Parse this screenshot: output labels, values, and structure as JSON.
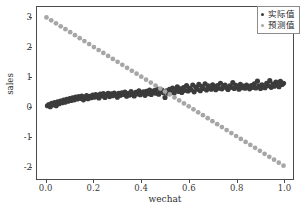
{
  "chart_data": {
    "type": "scatter",
    "title": "",
    "xlabel": "wechat",
    "ylabel": "sales",
    "xlim": [
      -0.04,
      1.04
    ],
    "ylim": [
      -2.45,
      3.35
    ],
    "xticks": [
      0.0,
      0.2,
      0.4,
      0.6,
      0.8,
      1.0
    ],
    "xtick_labels": [
      "0.0",
      "0.2",
      "0.4",
      "0.6",
      "0.8",
      "1.0"
    ],
    "yticks": [
      -2,
      -1,
      0,
      1,
      2,
      3
    ],
    "ytick_labels": [
      "-2",
      "-1",
      "0",
      "1",
      "2",
      "3"
    ],
    "grid": false,
    "legend_position": "upper right",
    "series": [
      {
        "name": "实际值",
        "color": "#3b3b3b",
        "marker": "o",
        "marker_size": 2.6,
        "points": [
          [
            0.004,
            0.02
          ],
          [
            0.01,
            0.06
          ],
          [
            0.016,
            -0.01
          ],
          [
            0.022,
            0.1
          ],
          [
            0.028,
            0.05
          ],
          [
            0.034,
            0.13
          ],
          [
            0.041,
            0.02
          ],
          [
            0.047,
            0.15
          ],
          [
            0.053,
            0.09
          ],
          [
            0.059,
            0.18
          ],
          [
            0.066,
            0.12
          ],
          [
            0.072,
            0.21
          ],
          [
            0.078,
            0.14
          ],
          [
            0.085,
            0.24
          ],
          [
            0.091,
            0.17
          ],
          [
            0.098,
            0.26
          ],
          [
            0.104,
            0.2
          ],
          [
            0.11,
            0.29
          ],
          [
            0.117,
            0.22
          ],
          [
            0.123,
            0.31
          ],
          [
            0.13,
            0.25
          ],
          [
            0.136,
            0.33
          ],
          [
            0.143,
            0.27
          ],
          [
            0.149,
            0.35
          ],
          [
            0.156,
            0.22
          ],
          [
            0.162,
            0.3
          ],
          [
            0.169,
            0.36
          ],
          [
            0.175,
            0.26
          ],
          [
            0.182,
            0.34
          ],
          [
            0.188,
            0.29
          ],
          [
            0.195,
            0.38
          ],
          [
            0.201,
            0.31
          ],
          [
            0.208,
            0.4
          ],
          [
            0.214,
            0.33
          ],
          [
            0.221,
            0.28
          ],
          [
            0.227,
            0.41
          ],
          [
            0.234,
            0.35
          ],
          [
            0.24,
            0.43
          ],
          [
            0.247,
            0.3
          ],
          [
            0.253,
            0.39
          ],
          [
            0.26,
            0.44
          ],
          [
            0.266,
            0.33
          ],
          [
            0.273,
            0.42
          ],
          [
            0.279,
            0.36
          ],
          [
            0.286,
            0.45
          ],
          [
            0.292,
            0.38
          ],
          [
            0.299,
            0.31
          ],
          [
            0.305,
            0.44
          ],
          [
            0.312,
            0.37
          ],
          [
            0.318,
            0.46
          ],
          [
            0.325,
            0.4
          ],
          [
            0.331,
            0.48
          ],
          [
            0.338,
            0.34
          ],
          [
            0.344,
            0.43
          ],
          [
            0.351,
            0.38
          ],
          [
            0.357,
            0.5
          ],
          [
            0.364,
            0.41
          ],
          [
            0.37,
            0.35
          ],
          [
            0.377,
            0.47
          ],
          [
            0.383,
            0.42
          ],
          [
            0.39,
            0.52
          ],
          [
            0.396,
            0.39
          ],
          [
            0.403,
            0.45
          ],
          [
            0.409,
            0.49
          ],
          [
            0.416,
            0.37
          ],
          [
            0.422,
            0.51
          ],
          [
            0.429,
            0.43
          ],
          [
            0.435,
            0.55
          ],
          [
            0.442,
            0.4
          ],
          [
            0.448,
            0.47
          ],
          [
            0.455,
            0.53
          ],
          [
            0.461,
            0.44
          ],
          [
            0.468,
            0.58
          ],
          [
            0.474,
            0.41
          ],
          [
            0.481,
            0.5
          ],
          [
            0.487,
            0.55
          ],
          [
            0.494,
            0.46
          ],
          [
            0.5,
            0.3
          ],
          [
            0.506,
            0.52
          ],
          [
            0.513,
            0.44
          ],
          [
            0.519,
            0.57
          ],
          [
            0.526,
            0.48
          ],
          [
            0.532,
            0.62
          ],
          [
            0.539,
            0.45
          ],
          [
            0.545,
            0.55
          ],
          [
            0.552,
            0.66
          ],
          [
            0.558,
            0.5
          ],
          [
            0.565,
            0.59
          ],
          [
            0.571,
            0.47
          ],
          [
            0.578,
            0.63
          ],
          [
            0.584,
            0.54
          ],
          [
            0.591,
            0.7
          ],
          [
            0.597,
            0.52
          ],
          [
            0.604,
            0.61
          ],
          [
            0.61,
            0.56
          ],
          [
            0.617,
            0.72
          ],
          [
            0.623,
            0.49
          ],
          [
            0.63,
            0.65
          ],
          [
            0.636,
            0.58
          ],
          [
            0.643,
            0.74
          ],
          [
            0.649,
            0.53
          ],
          [
            0.656,
            0.67
          ],
          [
            0.662,
            0.6
          ],
          [
            0.669,
            0.76
          ],
          [
            0.675,
            0.55
          ],
          [
            0.682,
            0.69
          ],
          [
            0.688,
            0.62
          ],
          [
            0.695,
            0.58
          ],
          [
            0.701,
            0.73
          ],
          [
            0.708,
            0.64
          ],
          [
            0.714,
            0.56
          ],
          [
            0.721,
            0.7
          ],
          [
            0.727,
            0.61
          ],
          [
            0.734,
            0.78
          ],
          [
            0.74,
            0.59
          ],
          [
            0.747,
            0.66
          ],
          [
            0.753,
            0.72
          ],
          [
            0.76,
            0.62
          ],
          [
            0.766,
            0.57
          ],
          [
            0.773,
            0.69
          ],
          [
            0.779,
            0.64
          ],
          [
            0.786,
            0.8
          ],
          [
            0.792,
            0.6
          ],
          [
            0.799,
            0.71
          ],
          [
            0.805,
            0.66
          ],
          [
            0.812,
            0.58
          ],
          [
            0.818,
            0.74
          ],
          [
            0.825,
            0.63
          ],
          [
            0.831,
            0.68
          ],
          [
            0.838,
            0.61
          ],
          [
            0.844,
            0.72
          ],
          [
            0.851,
            0.65
          ],
          [
            0.857,
            0.59
          ],
          [
            0.864,
            0.7
          ],
          [
            0.87,
            0.64
          ],
          [
            0.877,
            0.76
          ],
          [
            0.883,
            0.62
          ],
          [
            0.89,
            0.85
          ],
          [
            0.896,
            0.68
          ],
          [
            0.903,
            0.6
          ],
          [
            0.909,
            0.73
          ],
          [
            0.916,
            0.66
          ],
          [
            0.922,
            0.63
          ],
          [
            0.929,
            0.78
          ],
          [
            0.935,
            0.7
          ],
          [
            0.942,
            0.87
          ],
          [
            0.948,
            0.64
          ],
          [
            0.955,
            0.75
          ],
          [
            0.961,
            0.68
          ],
          [
            0.968,
            0.82
          ],
          [
            0.974,
            0.72
          ],
          [
            0.981,
            0.66
          ],
          [
            0.987,
            0.84
          ],
          [
            0.994,
            0.74
          ],
          [
            1.0,
            0.78
          ]
        ]
      },
      {
        "name": "预测值",
        "color": "#a6a6a6",
        "marker": "o",
        "marker_size": 2.4,
        "line_intercept": 3.0,
        "line_slope": -5.0,
        "points": [
          [
            0.0,
            3.0
          ],
          [
            0.02,
            2.9
          ],
          [
            0.04,
            2.8
          ],
          [
            0.06,
            2.7
          ],
          [
            0.08,
            2.6
          ],
          [
            0.1,
            2.5
          ],
          [
            0.12,
            2.4
          ],
          [
            0.14,
            2.3
          ],
          [
            0.16,
            2.2
          ],
          [
            0.18,
            2.1
          ],
          [
            0.2,
            2.0
          ],
          [
            0.22,
            1.9
          ],
          [
            0.24,
            1.8
          ],
          [
            0.26,
            1.7
          ],
          [
            0.28,
            1.6
          ],
          [
            0.3,
            1.5
          ],
          [
            0.32,
            1.4
          ],
          [
            0.34,
            1.3
          ],
          [
            0.36,
            1.2
          ],
          [
            0.38,
            1.1
          ],
          [
            0.4,
            1.0
          ],
          [
            0.42,
            0.9
          ],
          [
            0.44,
            0.8
          ],
          [
            0.46,
            0.7
          ],
          [
            0.48,
            0.6
          ],
          [
            0.5,
            0.5
          ],
          [
            0.52,
            0.4
          ],
          [
            0.54,
            0.3
          ],
          [
            0.56,
            0.2
          ],
          [
            0.58,
            0.1
          ],
          [
            0.6,
            0.0
          ],
          [
            0.62,
            -0.1
          ],
          [
            0.64,
            -0.2
          ],
          [
            0.66,
            -0.3
          ],
          [
            0.68,
            -0.4
          ],
          [
            0.7,
            -0.5
          ],
          [
            0.72,
            -0.6
          ],
          [
            0.74,
            -0.7
          ],
          [
            0.76,
            -0.8
          ],
          [
            0.78,
            -0.9
          ],
          [
            0.8,
            -1.0
          ],
          [
            0.82,
            -1.1
          ],
          [
            0.84,
            -1.2
          ],
          [
            0.86,
            -1.3
          ],
          [
            0.88,
            -1.4
          ],
          [
            0.9,
            -1.5
          ],
          [
            0.92,
            -1.6
          ],
          [
            0.94,
            -1.7
          ],
          [
            0.96,
            -1.8
          ],
          [
            0.98,
            -1.9
          ],
          [
            1.0,
            -2.0
          ]
        ]
      }
    ]
  },
  "legend": {
    "entries": [
      {
        "label": "实际值",
        "color": "#3b3b3b"
      },
      {
        "label": "预测值",
        "color": "#a6a6a6"
      }
    ]
  },
  "colors": {
    "actual": "#3b3b3b",
    "predicted": "#a6a6a6",
    "axis": "#4a4a4a",
    "background": "#ffffff"
  }
}
